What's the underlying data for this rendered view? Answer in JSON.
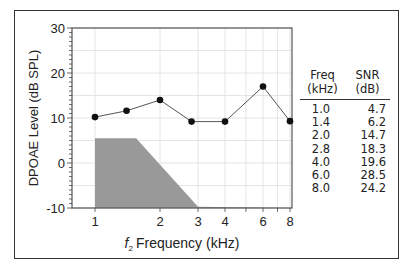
{
  "chart_data": {
    "type": "line",
    "title": "",
    "xlabel": "f2 Frequency (kHz)",
    "xlabel_sub": "2",
    "xlabel_main": "Frequency (kHz)",
    "xlabel_f": "f",
    "ylabel": "DPOAE Level (dB SPL)",
    "xscale": "log",
    "xlim": [
      1,
      8
    ],
    "ylim": [
      -10,
      30
    ],
    "x_ticks": [
      "1",
      "2",
      "3",
      "4",
      "6",
      "8"
    ],
    "y_ticks": [
      "30",
      "20",
      "10",
      "0",
      "-10"
    ],
    "grid": true,
    "series": [
      {
        "name": "DPOAE",
        "x": [
          1.0,
          1.4,
          2.0,
          2.8,
          4.0,
          6.0,
          8.0
        ],
        "values": [
          10.2,
          11.6,
          14.0,
          9.2,
          9.2,
          17.0,
          9.3
        ],
        "color": "#111111"
      },
      {
        "name": "Noise floor",
        "type": "area",
        "x": [
          1.0,
          1.55,
          3.0,
          8.0
        ],
        "values": [
          5.5,
          5.5,
          -9.7,
          -10
        ],
        "color": "#999999"
      }
    ],
    "table": {
      "headers": [
        [
          "Freq",
          "(kHz)"
        ],
        [
          "SNR",
          "(dB)"
        ]
      ],
      "rows": [
        [
          "1.0",
          "4.7"
        ],
        [
          "1.4",
          "6.2"
        ],
        [
          "2.0",
          "14.7"
        ],
        [
          "2.8",
          "18.3"
        ],
        [
          "4.0",
          "19.6"
        ],
        [
          "6.0",
          "28.5"
        ],
        [
          "8.0",
          "24.2"
        ]
      ]
    }
  }
}
